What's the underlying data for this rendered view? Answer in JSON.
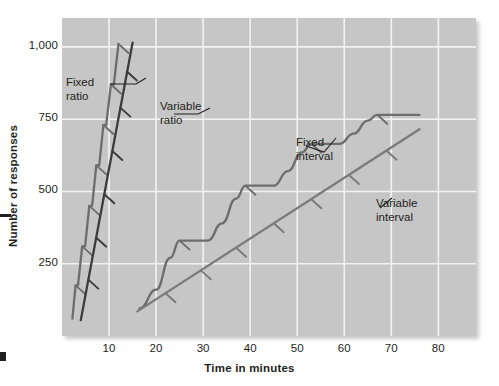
{
  "chart_data": {
    "type": "line",
    "title": "",
    "xlabel": "Time in minutes",
    "ylabel": "Number of responses",
    "xlim": [
      0,
      88
    ],
    "ylim": [
      0,
      1100
    ],
    "xticks": [
      10,
      20,
      30,
      40,
      50,
      60,
      70,
      80
    ],
    "xtick_labels": [
      "10",
      "20",
      "30",
      "40",
      "50",
      "60",
      "70",
      "80"
    ],
    "yticks": [
      250,
      500,
      750,
      1000
    ],
    "ytick_labels": [
      "250",
      "500",
      "750",
      "1,000"
    ],
    "grid": true,
    "grid_color": "#f2f2f2",
    "plot_background": "#c6c6c6",
    "legend_position": "inline-annotations",
    "series": [
      {
        "name": "Fixed ratio",
        "label": "Fixed\nratio",
        "label_line1": "Fixed",
        "label_line2": "ratio",
        "color": "#6d6d6d",
        "style": "stepped-steep-with-post-reinforcement-pause",
        "points": [
          {
            "x": 2.2,
            "y": 60
          },
          {
            "x": 2.9,
            "y": 175
          },
          {
            "x": 3.4,
            "y": 175
          },
          {
            "x": 4.3,
            "y": 310
          },
          {
            "x": 4.9,
            "y": 310
          },
          {
            "x": 5.8,
            "y": 450
          },
          {
            "x": 6.4,
            "y": 450
          },
          {
            "x": 7.3,
            "y": 590
          },
          {
            "x": 7.9,
            "y": 590
          },
          {
            "x": 8.8,
            "y": 730
          },
          {
            "x": 9.4,
            "y": 730
          },
          {
            "x": 10.4,
            "y": 870
          },
          {
            "x": 11.0,
            "y": 870
          },
          {
            "x": 12.0,
            "y": 1010
          }
        ],
        "hatch_marks": [
          {
            "x": 2.9,
            "y": 175
          },
          {
            "x": 4.3,
            "y": 310
          },
          {
            "x": 5.8,
            "y": 450
          },
          {
            "x": 7.3,
            "y": 590
          },
          {
            "x": 8.8,
            "y": 730
          },
          {
            "x": 10.4,
            "y": 870
          },
          {
            "x": 12.0,
            "y": 1010
          }
        ]
      },
      {
        "name": "Variable ratio",
        "label": "Variable\nratio",
        "label_line1": "Variable",
        "label_line2": "ratio",
        "color": "#3b3b3b",
        "style": "steady-steep-line",
        "points": [
          {
            "x": 4.0,
            "y": 55
          },
          {
            "x": 15.0,
            "y": 1015
          }
        ],
        "hatch_marks": [
          {
            "x": 5.6,
            "y": 195
          },
          {
            "x": 7.3,
            "y": 340
          },
          {
            "x": 9.0,
            "y": 490
          },
          {
            "x": 10.7,
            "y": 640
          },
          {
            "x": 12.4,
            "y": 790
          },
          {
            "x": 13.8,
            "y": 915
          }
        ]
      },
      {
        "name": "Fixed interval",
        "label": "Fixed\ninterval",
        "label_line1": "Fixed",
        "label_line2": "interval",
        "color": "#6d6d6d",
        "style": "scalloped",
        "points": [
          {
            "x": 16.5,
            "y": 95
          },
          {
            "x": 20.0,
            "y": 160
          },
          {
            "x": 23.0,
            "y": 270
          },
          {
            "x": 25.0,
            "y": 330
          },
          {
            "x": 31.0,
            "y": 330
          },
          {
            "x": 34.0,
            "y": 390
          },
          {
            "x": 37.0,
            "y": 475
          },
          {
            "x": 39.0,
            "y": 520
          },
          {
            "x": 45.0,
            "y": 520
          },
          {
            "x": 48.0,
            "y": 570
          },
          {
            "x": 51.0,
            "y": 635
          },
          {
            "x": 53.0,
            "y": 665
          },
          {
            "x": 59.0,
            "y": 665
          },
          {
            "x": 62.0,
            "y": 700
          },
          {
            "x": 65.0,
            "y": 745
          },
          {
            "x": 67.0,
            "y": 765
          },
          {
            "x": 76.0,
            "y": 765
          }
        ],
        "hatch_marks": [
          {
            "x": 25.0,
            "y": 330
          },
          {
            "x": 39.0,
            "y": 520
          },
          {
            "x": 53.0,
            "y": 665
          },
          {
            "x": 67.0,
            "y": 765
          }
        ]
      },
      {
        "name": "Variable interval",
        "label": "Variable\ninterval",
        "label_line1": "Variable",
        "label_line2": "interval",
        "color": "#7a7a7a",
        "style": "steady-shallow-line",
        "points": [
          {
            "x": 16.0,
            "y": 85
          },
          {
            "x": 76.0,
            "y": 715
          }
        ],
        "hatch_marks": [
          {
            "x": 22.0,
            "y": 148
          },
          {
            "x": 29.5,
            "y": 227
          },
          {
            "x": 37.0,
            "y": 305
          },
          {
            "x": 45.0,
            "y": 390
          },
          {
            "x": 53.0,
            "y": 473
          },
          {
            "x": 61.0,
            "y": 557
          },
          {
            "x": 69.0,
            "y": 641
          }
        ]
      }
    ]
  }
}
